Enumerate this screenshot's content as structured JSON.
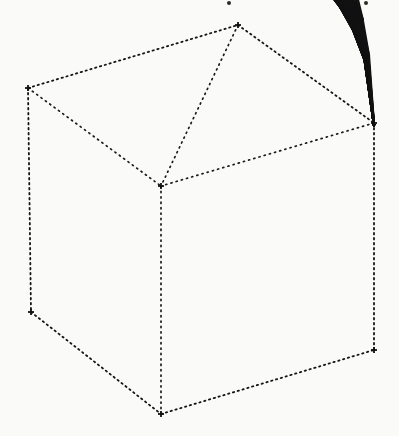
{
  "figure": {
    "kind": "3d-wireframe-surface-plot",
    "title": "",
    "caption": "",
    "background_color": "#fafaf8",
    "line_color": "#111111",
    "dashed_color": "#1a1a1a",
    "mesh_line_width": 2.3,
    "box_line_width": 1.6,
    "canvas": {
      "width": 399,
      "height": 436
    }
  },
  "bounding_box": {
    "style": "dotted",
    "vertices": {
      "top_back": [
        238,
        25
      ],
      "left": [
        28,
        88
      ],
      "right": [
        374,
        123
      ],
      "center_back": [
        161,
        186
      ],
      "bottom_left": [
        31,
        312
      ],
      "bottom_right": [
        374,
        350
      ],
      "bottom_front": [
        161,
        414
      ]
    },
    "visible_edges": [
      [
        [
          28,
          88
        ],
        [
          238,
          25
        ]
      ],
      [
        [
          238,
          25
        ],
        [
          374,
          123
        ]
      ],
      [
        [
          28,
          88
        ],
        [
          31,
          312
        ]
      ],
      [
        [
          374,
          123
        ],
        [
          374,
          350
        ]
      ],
      [
        [
          31,
          312
        ],
        [
          161,
          414
        ]
      ],
      [
        [
          161,
          414
        ],
        [
          374,
          350
        ]
      ]
    ],
    "hidden_edges": [
      [
        [
          28,
          88
        ],
        [
          161,
          186
        ]
      ],
      [
        [
          238,
          25
        ],
        [
          161,
          186
        ]
      ],
      [
        [
          374,
          123
        ],
        [
          161,
          186
        ]
      ],
      [
        [
          161,
          186
        ],
        [
          161,
          414
        ]
      ]
    ]
  },
  "chart_data": {
    "type": "surface",
    "title": "",
    "subtitle": "",
    "xlabel": "",
    "ylabel": "",
    "zlabel": "",
    "grid": false,
    "legend": null,
    "annotations": [],
    "tick_labels": {
      "x": [],
      "y": [],
      "z": []
    },
    "axis_ranges": {
      "x": [
        0,
        1
      ],
      "y": [
        0,
        1
      ],
      "z": [
        0,
        1
      ]
    },
    "mesh": {
      "rows": 16,
      "cols": 16,
      "triangulated": true,
      "diagonal_direction": "both",
      "shading": "wireframe-only",
      "degenerate_pole": [
        374,
        350
      ],
      "apex": [
        238,
        25
      ],
      "description": "Triangulated wireframe dome surface; parameter lines converge to a single singular point at the lower right corner of the domain."
    },
    "projection": {
      "type": "parallel",
      "origin": [
        161,
        186
      ],
      "x_axis_vector": [
        213,
        -61
      ],
      "y_axis_vector": [
        -133,
        -98
      ],
      "z_axis_vector": [
        0,
        228
      ]
    }
  },
  "scan_artifacts": [
    {
      "name": "top-edge-speck-left",
      "x": 227,
      "y": 1,
      "size": 4
    },
    {
      "name": "top-edge-speck-right",
      "x": 364,
      "y": 1,
      "size": 4
    }
  ]
}
